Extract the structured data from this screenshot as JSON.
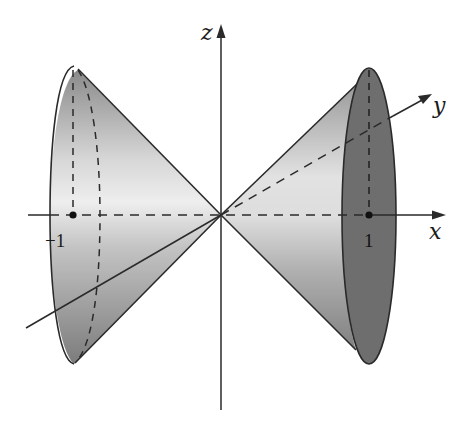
{
  "figure": {
    "axes": {
      "x_label": "x",
      "y_label": "y",
      "z_label": "z"
    },
    "tick_labels": {
      "left": "−1",
      "right": "1"
    },
    "colors": {
      "background": "#ffffff",
      "stroke": "#2a2a2a",
      "cone_light": "#f2f2f2",
      "cone_mid": "#b8b8b8",
      "cone_dark": "#7a7a7a",
      "ellipse_face": "#6e6e6e"
    }
  }
}
